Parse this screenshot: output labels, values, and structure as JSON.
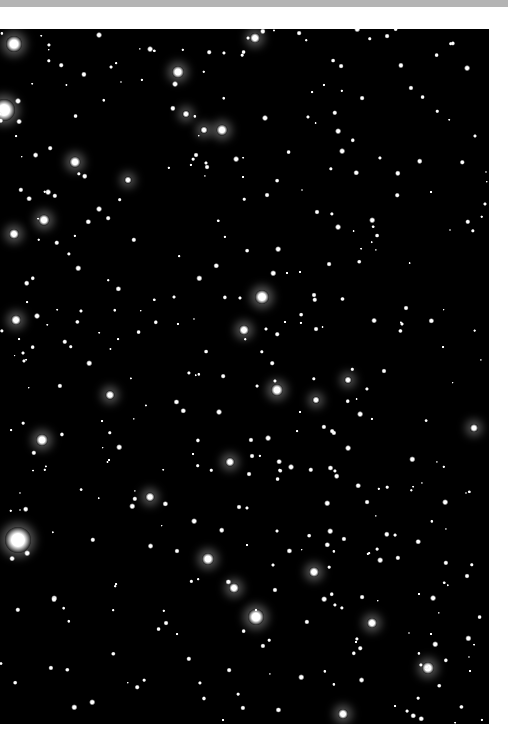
{
  "image": {
    "description": "Star field photograph of an open star cluster on a black sky",
    "background_color": "#000000",
    "frame": {
      "x": 0,
      "y": 29,
      "width": 489,
      "height": 695
    },
    "bright_stars": [
      [
        14,
        44,
        16
      ],
      [
        178,
        72,
        12
      ],
      [
        255,
        38,
        10
      ],
      [
        4,
        110,
        22
      ],
      [
        222,
        130,
        11
      ],
      [
        75,
        162,
        11
      ],
      [
        44,
        220,
        11
      ],
      [
        14,
        234,
        10
      ],
      [
        262,
        297,
        14
      ],
      [
        244,
        330,
        10
      ],
      [
        16,
        320,
        10
      ],
      [
        277,
        390,
        12
      ],
      [
        110,
        395,
        9
      ],
      [
        42,
        440,
        12
      ],
      [
        230,
        462,
        9
      ],
      [
        150,
        497,
        9
      ],
      [
        18,
        540,
        26
      ],
      [
        208,
        559,
        12
      ],
      [
        234,
        588,
        10
      ],
      [
        256,
        617,
        16
      ],
      [
        314,
        572,
        10
      ],
      [
        372,
        623,
        10
      ],
      [
        428,
        668,
        12
      ],
      [
        343,
        714,
        10
      ],
      [
        474,
        428,
        8
      ],
      [
        128,
        180,
        7
      ],
      [
        186,
        114,
        7
      ],
      [
        204,
        130,
        7
      ],
      [
        316,
        400,
        7
      ],
      [
        348,
        380,
        7
      ]
    ],
    "small_stars_count": 400
  }
}
